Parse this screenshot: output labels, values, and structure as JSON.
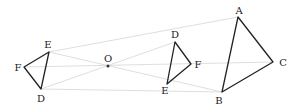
{
  "diagram": {
    "title": "",
    "center": {
      "label": "O",
      "x": 108,
      "y": 66
    },
    "triangles": [
      {
        "name": "left-triangle",
        "vertices": [
          {
            "label": "E",
            "x": 49,
            "y": 52,
            "lx": 48,
            "ly": 47
          },
          {
            "label": "F",
            "x": 24,
            "y": 67,
            "lx": 18,
            "ly": 71
          },
          {
            "label": "D",
            "x": 41,
            "y": 89,
            "lx": 41,
            "ly": 102
          }
        ]
      },
      {
        "name": "middle-triangle",
        "vertices": [
          {
            "label": "D",
            "x": 175,
            "y": 42,
            "lx": 174,
            "ly": 38
          },
          {
            "label": "F",
            "x": 191,
            "y": 64,
            "lx": 198,
            "ly": 67
          },
          {
            "label": "E",
            "x": 167,
            "y": 84,
            "lx": 165,
            "ly": 93
          }
        ]
      },
      {
        "name": "right-triangle",
        "vertices": [
          {
            "label": "A",
            "x": 238,
            "y": 17,
            "lx": 239,
            "ly": 14
          },
          {
            "label": "C",
            "x": 273,
            "y": 62,
            "lx": 283,
            "ly": 65
          },
          {
            "label": "B",
            "x": 222,
            "y": 92,
            "lx": 219,
            "ly": 104
          }
        ]
      }
    ],
    "rays": [
      {
        "from": [
          49,
          52
        ],
        "to": [
          238,
          17
        ]
      },
      {
        "from": [
          24,
          67
        ],
        "to": [
          273,
          62
        ]
      },
      {
        "from": [
          41,
          89
        ],
        "to": [
          222,
          92
        ]
      },
      {
        "from": [
          49,
          52
        ],
        "to": [
          167,
          84
        ]
      }
    ],
    "colors": {
      "stroke": "#222222",
      "ray": "#d4d4d4",
      "label": "#222222"
    }
  }
}
